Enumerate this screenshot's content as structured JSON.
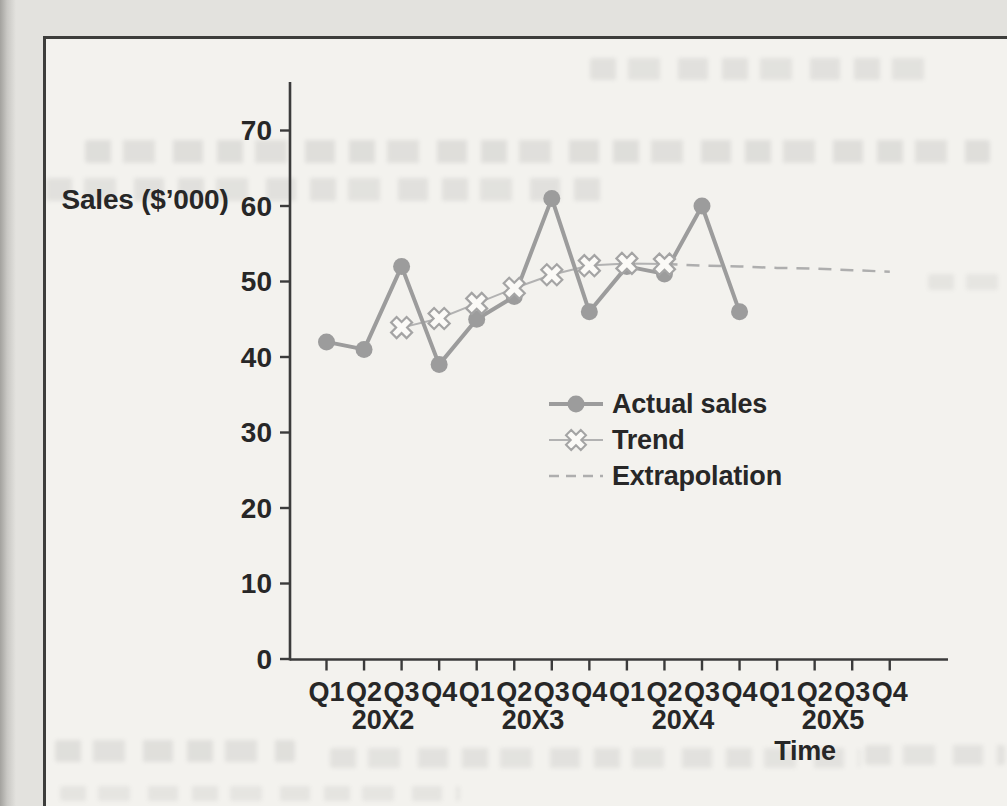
{
  "chart_data": {
    "type": "line",
    "title": "",
    "ylabel": "Sales ($’000)",
    "xlabel": "Time",
    "ylim": [
      0,
      70
    ],
    "y_ticks": [
      0,
      10,
      20,
      30,
      40,
      50,
      60,
      70
    ],
    "quarters": [
      "Q1",
      "Q2",
      "Q3",
      "Q4",
      "Q1",
      "Q2",
      "Q3",
      "Q4",
      "Q1",
      "Q2",
      "Q3",
      "Q4",
      "Q1",
      "Q2",
      "Q3",
      "Q4"
    ],
    "year_labels": [
      "20X2",
      "20X3",
      "20X4",
      "20X5"
    ],
    "grid": false,
    "legend_position": "middle-right",
    "series": [
      {
        "name": "Actual sales",
        "style": "solid-line-circle-markers",
        "color": "#9c9c9c",
        "start_index": 0,
        "values": [
          42,
          41,
          52,
          39,
          45,
          48,
          61,
          46,
          52,
          51,
          60,
          46
        ]
      },
      {
        "name": "Trend",
        "style": "thin-line-x-markers",
        "color": "#b2b2b2",
        "marker_fill": "#fbfaf7",
        "marker_stroke": "#a4a4a4",
        "start_index": 2,
        "values": [
          43.9,
          45.1,
          47.1,
          49.1,
          50.9,
          52.1,
          52.4,
          52.3
        ]
      },
      {
        "name": "Extrapolation",
        "style": "dashed-line",
        "color": "#aeaeae",
        "start_index": 9,
        "values": [
          52.3,
          52.1,
          52.0,
          51.8,
          51.7,
          51.5,
          51.3
        ]
      }
    ]
  },
  "colors": {
    "axis": "#3b3b3b",
    "label_text": "#272727",
    "page_bg": "#f3f2ee",
    "outer_bg": "#e3e2de",
    "border": "#3d3d3b",
    "series_gray": "#9c9c9c"
  }
}
